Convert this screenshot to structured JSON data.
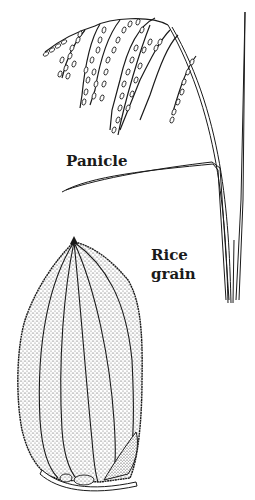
{
  "figure": {
    "type": "botanical-illustration",
    "labels": {
      "panicle": "Panicle",
      "grain_line1": "Rice",
      "grain_line2": "grain"
    },
    "colors": {
      "ink": "#1a1a1a",
      "background": "#ffffff"
    }
  }
}
